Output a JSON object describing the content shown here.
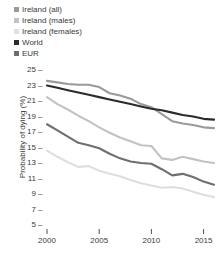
{
  "chart_data": {
    "type": "line",
    "title": "",
    "xlabel": "",
    "ylabel": "Probability of dying (%)",
    "xlim": [
      2000,
      2016
    ],
    "ylim": [
      4,
      26
    ],
    "yticks": [
      5,
      7,
      9,
      11,
      13,
      15,
      17,
      19,
      21,
      23,
      25
    ],
    "xticks": [
      2000,
      2005,
      2010,
      2015
    ],
    "grid": false,
    "legend_position": "above-left",
    "x": [
      2000,
      2001,
      2002,
      2003,
      2004,
      2005,
      2006,
      2007,
      2008,
      2009,
      2010,
      2011,
      2012,
      2013,
      2014,
      2015,
      2016
    ],
    "series": [
      {
        "name": "Ireland (all)",
        "color": "#9a9a9a",
        "values": [
          23.6,
          23.4,
          23.2,
          23.1,
          23.1,
          22.8,
          22.0,
          21.7,
          21.3,
          20.6,
          20.2,
          19.3,
          18.4,
          18.1,
          17.9,
          17.6,
          17.5
        ]
      },
      {
        "name": "Ireland (males)",
        "color": "#c2c2c2",
        "values": [
          21.5,
          20.6,
          19.9,
          19.1,
          18.4,
          17.6,
          16.9,
          16.3,
          15.8,
          15.3,
          15.2,
          13.6,
          13.4,
          13.8,
          13.5,
          13.2,
          13.0
        ]
      },
      {
        "name": "Ireland (females)",
        "color": "#dedede",
        "values": [
          14.6,
          13.8,
          13.1,
          12.5,
          12.6,
          12.0,
          11.6,
          11.3,
          10.8,
          10.4,
          10.1,
          9.8,
          9.9,
          9.7,
          9.3,
          8.9,
          8.6
        ]
      },
      {
        "name": "World",
        "color": "#2b2b2b",
        "values": [
          23.0,
          22.7,
          22.4,
          22.1,
          21.8,
          21.5,
          21.2,
          20.9,
          20.6,
          20.3,
          20.0,
          19.8,
          19.5,
          19.2,
          19.0,
          18.7,
          18.6
        ]
      },
      {
        "name": "EUR",
        "color": "#6e6e6e",
        "values": [
          18.0,
          17.2,
          16.4,
          15.6,
          15.3,
          14.9,
          14.2,
          13.6,
          13.2,
          13.0,
          12.9,
          12.2,
          11.4,
          11.6,
          11.2,
          10.6,
          10.2
        ]
      }
    ]
  },
  "legend": {
    "items": [
      {
        "label": "Ireland (all)",
        "color": "#9a9a9a"
      },
      {
        "label": "Ireland (males)",
        "color": "#c2c2c2"
      },
      {
        "label": "Ireland (females)",
        "color": "#e2e2e2"
      },
      {
        "label": "World",
        "color": "#2b2b2b"
      },
      {
        "label": "EUR",
        "color": "#6e6e6e"
      }
    ]
  },
  "axes": {
    "ylabel": "Probability of dying (%)",
    "ytick_labels": [
      "25",
      "23",
      "21",
      "19",
      "17",
      "15",
      "13",
      "11",
      "9",
      "7",
      "5"
    ],
    "xtick_labels": [
      "2000",
      "2005",
      "2010",
      "2015"
    ],
    "tick_dash": "–"
  }
}
